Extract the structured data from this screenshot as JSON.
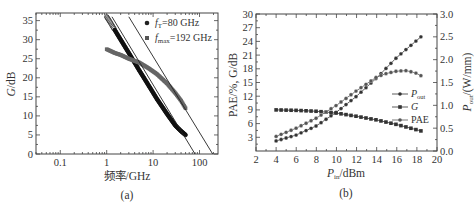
{
  "chart_data": [
    {
      "panel": "(a)",
      "type": "scatter",
      "title": "",
      "xlabel": "频率/GHz",
      "ylabel": "G/dB",
      "xscale": "log",
      "xlim": [
        0.03,
        250
      ],
      "ylim": [
        0,
        37
      ],
      "xticks": [
        "0.1",
        "1",
        "10",
        "100"
      ],
      "yticks": [
        "0",
        "5",
        "10",
        "15",
        "20",
        "25",
        "30",
        "35"
      ],
      "legend": [
        "fT=80 GHz",
        "fmax=192 GHz"
      ],
      "legend_position": "upper right",
      "series": [
        {
          "name": "fT=80 GHz (h21)",
          "marker": "circle",
          "x": [
            1,
            1.2,
            1.5,
            2,
            3,
            5,
            8,
            12,
            20,
            30,
            40,
            50
          ],
          "values": [
            36,
            34.5,
            32.5,
            30,
            26.5,
            22,
            18,
            14.5,
            10.5,
            7.5,
            6,
            5
          ]
        },
        {
          "name": "fmax=192 GHz (MAG/MSG)",
          "marker": "square",
          "x": [
            1,
            1.5,
            2,
            3,
            5,
            8,
            12,
            20,
            30,
            40,
            50
          ],
          "values": [
            27.5,
            26.5,
            26,
            25,
            24,
            22.5,
            21,
            18.5,
            16,
            14,
            12
          ]
        },
        {
          "name": "fT -20 dB/dec fit",
          "marker": "line",
          "x": [
            1.3,
            80
          ],
          "values": [
            36,
            0
          ]
        },
        {
          "name": "fmax -20 dB/dec fit",
          "marker": "line",
          "x": [
            3,
            192
          ],
          "values": [
            36,
            0
          ]
        }
      ]
    },
    {
      "panel": "(b)",
      "type": "line",
      "title": "",
      "xlabel": "Pin/dBm",
      "ylabel": "PAE/%, G/dB",
      "y2label": "Pout/(W/mm)",
      "xlim": [
        2,
        20
      ],
      "ylim": [
        0,
        30
      ],
      "y2lim": [
        0,
        3.0
      ],
      "xticks": [
        "2",
        "4",
        "6",
        "8",
        "10",
        "12",
        "14",
        "16",
        "18",
        "20"
      ],
      "yticks": [
        "3",
        "6",
        "9",
        "12",
        "15",
        "18",
        "21",
        "24",
        "27",
        "30"
      ],
      "y2ticks": [
        "0.0",
        "0.5",
        "1.0",
        "1.5",
        "2.0",
        "2.5",
        "3.0"
      ],
      "legend": [
        "Pout",
        "G",
        "PAE"
      ],
      "legend_position": "center right",
      "series": [
        {
          "name": "Pout",
          "axis": "right",
          "x": [
            4,
            6,
            8,
            10,
            12,
            14,
            16,
            18.4
          ],
          "values": [
            0.22,
            0.35,
            0.55,
            0.85,
            1.2,
            1.6,
            2.05,
            2.5
          ]
        },
        {
          "name": "G",
          "axis": "left",
          "x": [
            4,
            6,
            8,
            10,
            12,
            14,
            16,
            18.4
          ],
          "values": [
            9,
            8.9,
            8.7,
            8.3,
            7.6,
            6.8,
            5.8,
            4.4
          ]
        },
        {
          "name": "PAE",
          "axis": "left",
          "x": [
            4,
            6,
            8,
            10,
            12,
            14,
            15,
            16,
            17,
            18,
            18.4
          ],
          "values": [
            3.2,
            5,
            7.2,
            10,
            13.2,
            16.2,
            17,
            17.5,
            17.6,
            17,
            16.5
          ]
        }
      ]
    }
  ],
  "labels": {
    "a": {
      "ylabel_italic": "G",
      "ylabel_rest": "/dB",
      "xlabel": "频率/GHz",
      "caption": "(a)",
      "legend1_sym": "f",
      "legend1_sub": "T",
      "legend1_rest": "=80 GHz",
      "legend2_sym": "f",
      "legend2_sub": "max",
      "legend2_rest": "=192 GHz"
    },
    "b": {
      "ylabel": "PAE/%, G/dB",
      "y2_sym": "P",
      "y2_sub": "out",
      "y2_rest": "/(W/mm)",
      "xlabel_sym": "P",
      "xlabel_sub": "in",
      "xlabel_rest": "/dBm",
      "caption": "(b)",
      "legend_pout_sym": "P",
      "legend_pout_sub": "out",
      "legend_g": "G",
      "legend_pae": "PAE"
    }
  }
}
